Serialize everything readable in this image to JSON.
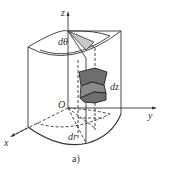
{
  "diagram": {
    "type": "cylindrical-coordinate-element",
    "labels": {
      "z_axis": "z",
      "y_axis": "y",
      "x_axis": "x",
      "origin": "O",
      "d_theta": "dθ",
      "d_z": "dz",
      "d_r": "dr"
    },
    "caption": "a)",
    "colors": {
      "line": "#333333",
      "shade_light": "#c8c8c8",
      "shade_dark": "#6e6e6e"
    }
  }
}
